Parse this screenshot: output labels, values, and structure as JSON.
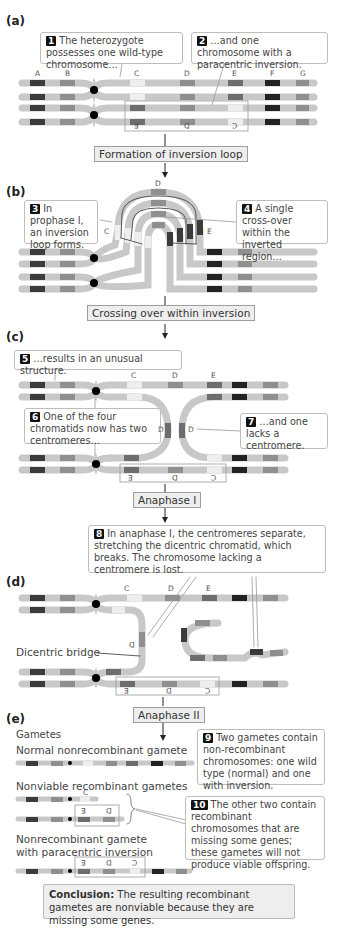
{
  "panels": {
    "a": {
      "label": "(a)",
      "callout_1": {
        "num": "1",
        "text": "The heterozygote possesses one wild-type chromosome…"
      },
      "callout_2": {
        "num": "2",
        "text": "…and one chromosome with a paracentric inversion."
      },
      "genes": [
        "A",
        "B",
        "C",
        "D",
        "E",
        "F",
        "G"
      ],
      "inverted_genes": [
        "E",
        "D",
        "C"
      ]
    },
    "b": {
      "label": "(b)",
      "callout_3": {
        "num": "3",
        "text": "In prophase I, an inversion loop forms."
      },
      "callout_4": {
        "num": "4",
        "text": "A single cross-over within the inverted region…"
      },
      "genes": [
        "C",
        "D",
        "E"
      ]
    },
    "c": {
      "label": "(c)",
      "callout_5": {
        "num": "5",
        "text": "…results in an unusual structure."
      },
      "callout_6": {
        "num": "6",
        "text": "One of the four chromatids now has two centromeres…"
      },
      "callout_7": {
        "num": "7",
        "text": "…and one lacks a centromere."
      },
      "genes": [
        "C",
        "D",
        "E"
      ],
      "loop_genes": [
        "D",
        "D"
      ],
      "inverted_genes": [
        "E",
        "D",
        "C"
      ]
    },
    "d": {
      "label": "(d)",
      "callout_8": {
        "num": "8",
        "text": "In anaphase I, the centromeres separate, stretching the dicentric chromatid, which breaks. The chromosome lacking a centromere is lost."
      },
      "genes": [
        "C",
        "D",
        "E"
      ],
      "bridge_gene": "D",
      "bridge_label": "Dicentric bridge",
      "inverted_genes": [
        "E",
        "D",
        "C"
      ]
    },
    "e": {
      "label": "(e)",
      "gametes_heading": "Gametes",
      "normal_label": "Normal nonrecombinant gamete",
      "nonviable_label": "Nonviable recombinant gametes",
      "nonviable_gene_1": "C",
      "nonviable_genes_2": [
        "E",
        "D"
      ],
      "inversion_label_line1": "Nonrecombinant gamete",
      "inversion_label_line2": "with paracentric inversion",
      "inversion_genes": [
        "E",
        "D",
        "C"
      ],
      "callout_9": {
        "num": "9",
        "text": "Two gametes contain non-recombinant chromosomes: one wild type (normal) and one with inversion."
      },
      "callout_10": {
        "num": "10",
        "text": "The other two contain recombinant chromosomes that are missing some genes; these gametes will not produce viable offspring."
      }
    }
  },
  "steps": {
    "formation": "Formation of inversion loop",
    "crossing": "Crossing over within inversion",
    "anaphase1": "Anaphase I",
    "anaphase2": "Anaphase II"
  },
  "conclusion": {
    "bold": "Conclusion:",
    "text": " The resulting recombinant gametes are nonviable because they are missing some genes."
  },
  "colors": {
    "chromatid": "#c8c8c8",
    "light_seg": "#e4e4e4",
    "mid_seg": "#8f8f8f",
    "dark_seg": "#3b3b3b",
    "medium_seg": "#6d6d6d",
    "centromere": "#000000",
    "step_box": "#eeeeee"
  }
}
